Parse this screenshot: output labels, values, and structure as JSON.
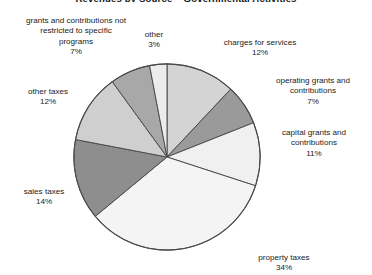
{
  "chart_data": {
    "type": "pie",
    "title": "Revenues by Source – Governmental Activities",
    "xlabel": "",
    "ylabel": "",
    "legend": "none",
    "grid": false,
    "start_angle_deg": 0,
    "direction": "clockwise",
    "categories": [
      "charges for services",
      "operating grants and contributions",
      "capital grants and contributions",
      "property taxes",
      "sales taxes",
      "other taxes",
      "grants and contributions not restricted to specific programs",
      "other"
    ],
    "values": [
      12,
      7,
      11,
      34,
      14,
      12,
      7,
      3
    ],
    "value_labels": [
      "12%",
      "7%",
      "11%",
      "34%",
      "14%",
      "12%",
      "7%",
      "3%"
    ],
    "colors": [
      "#d4d4d4",
      "#9a9a9a",
      "#f0f0f0",
      "#f4f4f4",
      "#8e8e8e",
      "#cfcfcf",
      "#a8a8a8",
      "#ececec"
    ],
    "slice_border_color": "#4a4a4a",
    "slices": [
      {
        "label": "charges for services",
        "pct": 12,
        "pct_text": "12%",
        "color": "#d4d4d4",
        "start": 0,
        "end": 43.2
      },
      {
        "label": "operating grants and contributions",
        "pct": 7,
        "pct_text": "7%",
        "color": "#9a9a9a",
        "start": 43.2,
        "end": 68.4
      },
      {
        "label": "capital grants and contributions",
        "pct": 11,
        "pct_text": "11%",
        "color": "#f0f0f0",
        "start": 68.4,
        "end": 108.0
      },
      {
        "label": "property taxes",
        "pct": 34,
        "pct_text": "34%",
        "color": "#f4f4f4",
        "start": 108.0,
        "end": 230.4
      },
      {
        "label": "sales taxes",
        "pct": 14,
        "pct_text": "14%",
        "color": "#8e8e8e",
        "start": 230.4,
        "end": 280.8
      },
      {
        "label": "other taxes",
        "pct": 12,
        "pct_text": "12%",
        "color": "#cfcfcf",
        "start": 280.8,
        "end": 324.0
      },
      {
        "label": "grants and contributions not restricted to specific programs",
        "pct": 7,
        "pct_text": "7%",
        "color": "#a8a8a8",
        "start": 324.0,
        "end": 349.2
      },
      {
        "label": "other",
        "pct": 3,
        "pct_text": "3%",
        "color": "#ececec",
        "start": 349.2,
        "end": 360.0
      }
    ]
  },
  "labels": {
    "grants_not_restricted": {
      "name": "grants and contributions not\nrestricted to specific\nprograms",
      "pct": "7%"
    },
    "other": {
      "name": "other",
      "pct": "3%"
    },
    "charges_for_services": {
      "name": "charges for services",
      "pct": "12%"
    },
    "operating_grants": {
      "name": "operating grants and\ncontributions",
      "pct": "7%"
    },
    "capital_grants": {
      "name": "capital grants and\ncontributions",
      "pct": "11%"
    },
    "property_taxes": {
      "name": "property taxes",
      "pct": "34%"
    },
    "sales_taxes": {
      "name": "sales taxes",
      "pct": "14%"
    },
    "other_taxes": {
      "name": "other taxes",
      "pct": "12%"
    }
  },
  "title": "Revenues by Source – Governmental Activities"
}
